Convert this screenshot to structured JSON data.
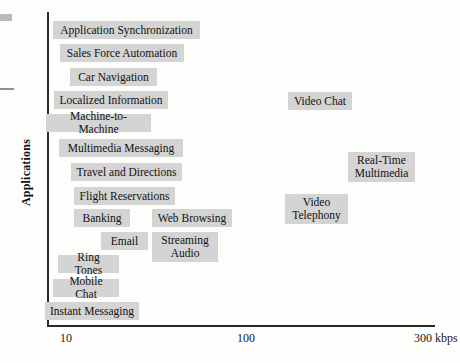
{
  "chart_data": {
    "type": "scatter",
    "title": "",
    "xlabel": "",
    "ylabel": "Applications",
    "xscale": "log",
    "xticks": [
      {
        "label": "10",
        "x": 60
      },
      {
        "label": "100",
        "x": 237
      },
      {
        "label": "300 kbps",
        "x": 414
      }
    ],
    "xtick_labels": [
      "10",
      "100",
      "300 kbps"
    ],
    "grid": false,
    "legend": null,
    "note": "Qualitative positioning chart: each labelled box is an application placed along a logarithmic data-rate axis (kbps) versus an unlabeled 'Applications' ordinate.",
    "points": [
      {
        "label": "Application Synchronization",
        "x": 53,
        "y": 21,
        "w": 147,
        "h": 18,
        "bitrate_kbps": 13
      },
      {
        "label": "Sales Force Automation",
        "x": 60,
        "y": 44,
        "w": 124,
        "h": 18,
        "bitrate_kbps": 14
      },
      {
        "label": "Car Navigation",
        "x": 70,
        "y": 68,
        "w": 87,
        "h": 18,
        "bitrate_kbps": 15
      },
      {
        "label": "Localized Information",
        "x": 54,
        "y": 91,
        "w": 114,
        "h": 18,
        "bitrate_kbps": 13
      },
      {
        "label": "Machine-to-Machine",
        "x": 46,
        "y": 114,
        "w": 105,
        "h": 18,
        "bitrate_kbps": 11
      },
      {
        "label": "Multimedia Messaging",
        "x": 59,
        "y": 139,
        "w": 124,
        "h": 18,
        "bitrate_kbps": 14
      },
      {
        "label": "Travel and Directions",
        "x": 71,
        "y": 163,
        "w": 111,
        "h": 18,
        "bitrate_kbps": 16
      },
      {
        "label": "Flight Reservations",
        "x": 74,
        "y": 187,
        "w": 101,
        "h": 18,
        "bitrate_kbps": 16
      },
      {
        "label": "Banking",
        "x": 74,
        "y": 209,
        "w": 56,
        "h": 18,
        "bitrate_kbps": 16
      },
      {
        "label": "Email",
        "x": 101,
        "y": 232,
        "w": 47,
        "h": 18,
        "bitrate_kbps": 20
      },
      {
        "label": "Ring Tones",
        "x": 58,
        "y": 255,
        "w": 61,
        "h": 18,
        "bitrate_kbps": 14
      },
      {
        "label": "Mobile Chat",
        "x": 53,
        "y": 279,
        "w": 66,
        "h": 18,
        "bitrate_kbps": 13
      },
      {
        "label": "Instant Messaging",
        "x": 45,
        "y": 302,
        "w": 94,
        "h": 18,
        "bitrate_kbps": 11
      },
      {
        "label": "Web Browsing",
        "x": 152,
        "y": 209,
        "w": 80,
        "h": 18,
        "bitrate_kbps": 35
      },
      {
        "label": "Streaming\nAudio",
        "x": 152,
        "y": 232,
        "w": 66,
        "h": 30,
        "bitrate_kbps": 35
      },
      {
        "label": "Video Chat",
        "x": 288,
        "y": 92,
        "w": 64,
        "h": 18,
        "bitrate_kbps": 130
      },
      {
        "label": "Video\nTelephony",
        "x": 285,
        "y": 194,
        "w": 63,
        "h": 30,
        "bitrate_kbps": 125
      },
      {
        "label": "Real-Time\nMultimedia",
        "x": 348,
        "y": 152,
        "w": 67,
        "h": 30,
        "bitrate_kbps": 215
      }
    ]
  },
  "figure": {
    "axis_y_label": "Applications",
    "box_fill": "#d4d4d4",
    "axis_color": "#2a2a2a",
    "text_color": "#111111"
  }
}
